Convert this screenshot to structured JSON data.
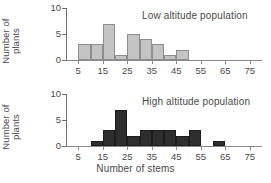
{
  "figure": {
    "x_axis_title": "Number of stems",
    "y_axis_title_line1": "Number of",
    "y_axis_title_line2": "plants"
  },
  "chart_data": [
    {
      "type": "bar",
      "title": "Low altitude population",
      "xlabel": "Number of stems",
      "ylabel": "Number of plants",
      "categories": [
        "5-10",
        "10-15",
        "15-20",
        "20-25",
        "25-30",
        "30-35",
        "35-40",
        "40-45",
        "45-50",
        "50-55",
        "55-60",
        "60-65",
        "65-70",
        "70-75",
        "75-80"
      ],
      "bin_starts": [
        5,
        10,
        15,
        20,
        25,
        30,
        35,
        40,
        45,
        50,
        55,
        60,
        65,
        70,
        75
      ],
      "bin_width": 5,
      "values": [
        3,
        3,
        7,
        1,
        5,
        4,
        3,
        1,
        2,
        0,
        0,
        0,
        0,
        0,
        0
      ],
      "ylim": [
        0,
        10
      ],
      "yticks": [
        0,
        5,
        10
      ],
      "xticks": [
        5,
        15,
        25,
        35,
        45,
        55,
        65,
        75
      ],
      "xlim": [
        0,
        80
      ],
      "bar_color": "#c4c4c4",
      "bar_edge_color": "#8d8d8d",
      "grid": false,
      "legend": "none"
    },
    {
      "type": "bar",
      "title": "High altitude population",
      "xlabel": "Number of stems",
      "ylabel": "Number of plants",
      "categories": [
        "5-10",
        "10-15",
        "15-20",
        "20-25",
        "25-30",
        "30-35",
        "35-40",
        "40-45",
        "45-50",
        "50-55",
        "55-60",
        "60-65",
        "65-70",
        "70-75",
        "75-80"
      ],
      "bin_starts": [
        5,
        10,
        15,
        20,
        25,
        30,
        35,
        40,
        45,
        50,
        55,
        60,
        65,
        70,
        75
      ],
      "bin_width": 5,
      "values": [
        0,
        1,
        3,
        7,
        2,
        3,
        3,
        3,
        2,
        3,
        0,
        1,
        0,
        0,
        0
      ],
      "ylim": [
        0,
        10
      ],
      "yticks": [
        0,
        5,
        10
      ],
      "xticks": [
        5,
        15,
        25,
        35,
        45,
        55,
        65,
        75
      ],
      "xlim": [
        0,
        80
      ],
      "bar_color": "#2e2e2e",
      "bar_edge_color": "#1d1d1d",
      "grid": false,
      "legend": "none"
    }
  ],
  "panels": [
    {
      "note": "Low altitude population",
      "y_tick_labels": [
        "0",
        "5",
        "10"
      ],
      "x_tick_labels": [
        "5",
        "15",
        "25",
        "35",
        "45",
        "55",
        "65",
        "75"
      ]
    },
    {
      "note": "High altitude population",
      "y_tick_labels": [
        "0",
        "5",
        "10"
      ],
      "x_tick_labels": [
        "5",
        "15",
        "25",
        "35",
        "45",
        "55",
        "65",
        "75"
      ]
    }
  ]
}
